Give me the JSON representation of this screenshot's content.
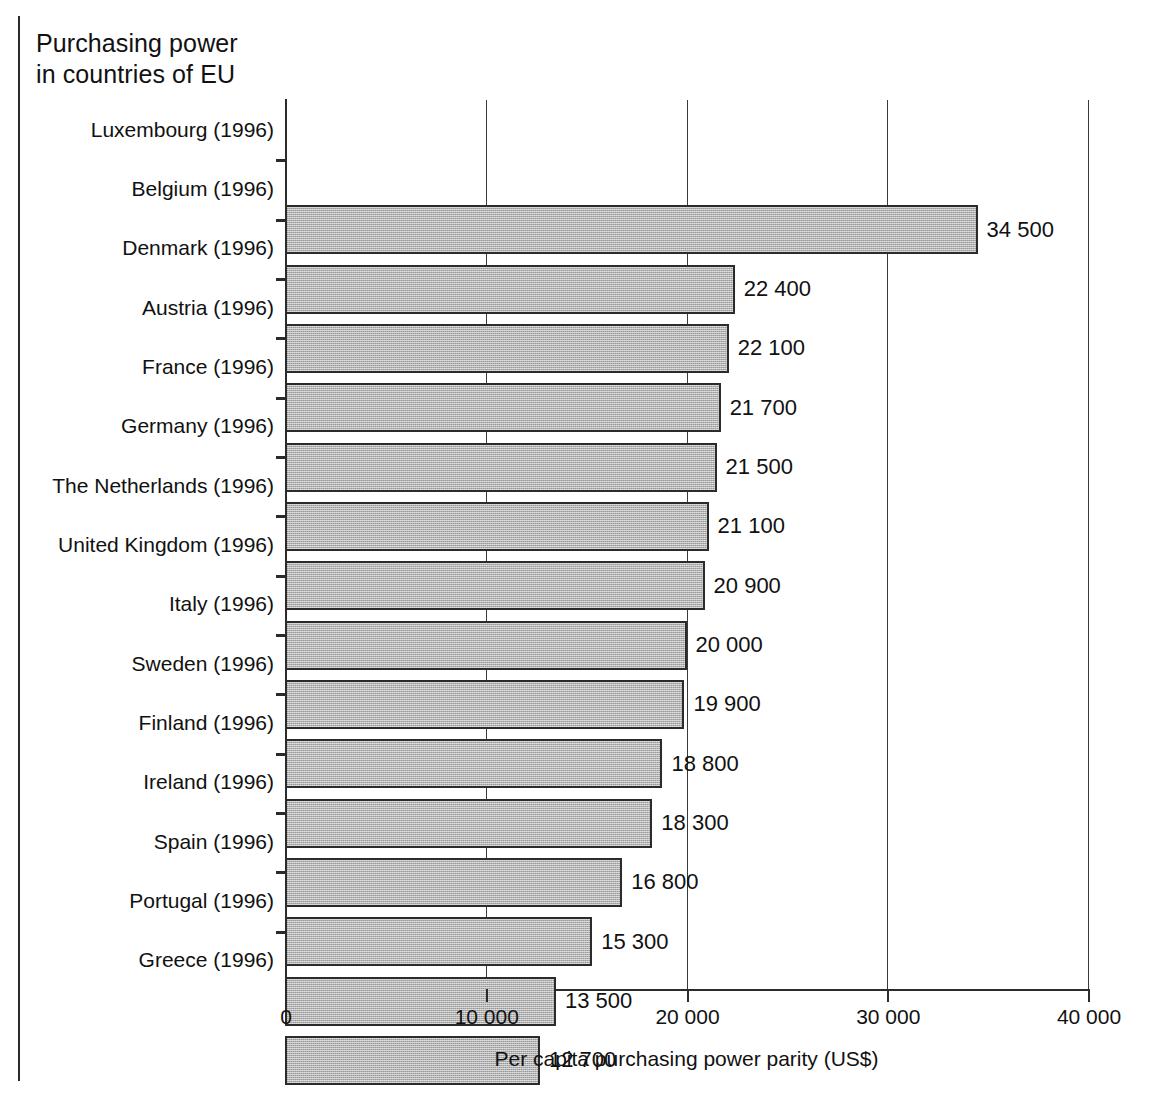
{
  "title_line1": "Purchasing power",
  "title_line2": "in countries of EU",
  "chart_data": {
    "type": "bar",
    "orientation": "horizontal",
    "subtitle": "",
    "xlabel": "Per capita purchasing power parity (US$)",
    "ylabel": "",
    "xlim": [
      0,
      40000
    ],
    "xticks": [
      0,
      10000,
      20000,
      30000,
      40000
    ],
    "xtick_labels": [
      "0",
      "10 000",
      "20 000",
      "30 000",
      "40 000"
    ],
    "grid": "vertical",
    "legend": "none",
    "bar_fill": "#b3b3b3",
    "bar_edge": "#2b2b2b",
    "categories": [
      "Luxembourg (1996)",
      "Belgium (1996)",
      "Denmark (1996)",
      "Austria (1996)",
      "France (1996)",
      "Germany (1996)",
      "The Netherlands (1996)",
      "United Kingdom (1996)",
      "Italy (1996)",
      "Sweden (1996)",
      "Finland (1996)",
      "Ireland (1996)",
      "Spain (1996)",
      "Portugal (1996)",
      "Greece (1996)"
    ],
    "values": [
      34500,
      22400,
      22100,
      21700,
      21500,
      21100,
      20900,
      20000,
      19900,
      18800,
      18300,
      16800,
      15300,
      13500,
      12700
    ],
    "value_labels": [
      "34 500",
      "22 400",
      "22 100",
      "21 700",
      "21 500",
      "21 100",
      "20 900",
      "20 000",
      "19 900",
      "18 800",
      "18 300",
      "16 800",
      "15 300",
      "13 500",
      "12 700"
    ]
  }
}
